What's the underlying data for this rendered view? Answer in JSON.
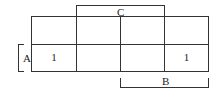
{
  "kmap": {
    "variables": {
      "row": "A",
      "col_top": "C",
      "col_bottom": "B"
    },
    "rows": [
      [
        "",
        "",
        "",
        ""
      ],
      [
        "1",
        "",
        "",
        "1"
      ]
    ]
  },
  "labels": {
    "a": "A",
    "b": "B",
    "c": "C"
  }
}
